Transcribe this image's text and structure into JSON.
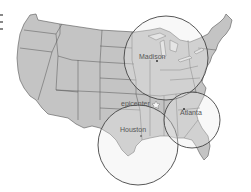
{
  "map": {
    "title": "United States map with radius circles",
    "land_color": "#c4c4c4",
    "border_color": "#555555",
    "circle_stroke": "#444444",
    "background": "#ffffff",
    "circles": [
      {
        "id": "madison",
        "label": "Madison",
        "cx": 166,
        "cy": 58,
        "r": 42
      },
      {
        "id": "houston",
        "label": "Houston",
        "cx": 138,
        "cy": 145,
        "r": 40
      },
      {
        "id": "atlanta",
        "label": "Atlanta",
        "cx": 192,
        "cy": 120,
        "r": 28
      }
    ],
    "markers": [
      {
        "id": "epicenter",
        "label": "epicenter",
        "x": 150,
        "y": 103
      },
      {
        "id": "madison-dot",
        "x": 157,
        "y": 60
      },
      {
        "id": "atlanta-dot",
        "x": 184,
        "y": 110
      }
    ],
    "labels": {
      "madison": "Madison",
      "houston": "Houston",
      "atlanta": "Atlanta",
      "epicenter": "epicenter"
    }
  }
}
